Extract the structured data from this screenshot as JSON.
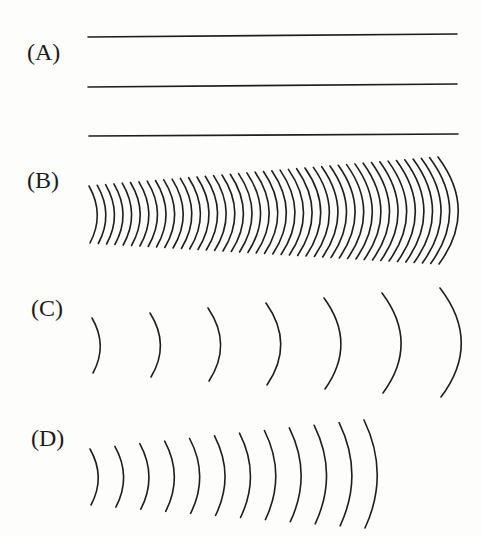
{
  "figure": {
    "panels": [
      {
        "id": "A",
        "label": "(A)",
        "label_pos": [
          27,
          60
        ],
        "type": "plane-wavefronts",
        "lines": [
          {
            "x1": 88,
            "y1": 37,
            "x2": 457,
            "y2": 34
          },
          {
            "x1": 88,
            "y1": 87,
            "x2": 457,
            "y2": 84
          },
          {
            "x1": 89,
            "y1": 136,
            "x2": 458,
            "y2": 134
          }
        ]
      },
      {
        "id": "B",
        "label": "(B)",
        "label_pos": [
          27,
          188
        ],
        "type": "curved-wavefronts-dense",
        "arc_count": 43,
        "first": {
          "x": 89,
          "top": 186,
          "bottom": 243,
          "bulge": 8
        },
        "last": {
          "x": 438,
          "top": 157,
          "bottom": 264,
          "bulge": 20
        }
      },
      {
        "id": "C",
        "label": "(C)",
        "label_pos": [
          31,
          316
        ],
        "type": "curved-wavefronts-sparse",
        "arc_count": 7,
        "first": {
          "x": 92,
          "top": 318,
          "bottom": 373,
          "bulge": 8
        },
        "last": {
          "x": 440,
          "top": 288,
          "bottom": 397,
          "bulge": 21
        }
      },
      {
        "id": "D",
        "label": "(D)",
        "label_pos": [
          31,
          446
        ],
        "type": "curved-wavefronts-medium",
        "arc_count": 12,
        "first": {
          "x": 90,
          "top": 449,
          "bottom": 505,
          "bulge": 8
        },
        "last": {
          "x": 364,
          "top": 420,
          "bottom": 528,
          "bulge": 13
        }
      }
    ]
  }
}
